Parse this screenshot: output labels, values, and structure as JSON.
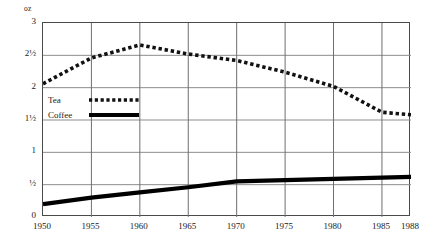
{
  "chart_data": {
    "type": "line",
    "title": "",
    "xlabel": "",
    "ylabel": "oz",
    "unit_label": "oz",
    "xlim": [
      1950,
      1988
    ],
    "ylim": [
      0,
      3
    ],
    "grid": true,
    "legend_position": "inside-upper-left",
    "x_tick_labels": [
      "1950",
      "1955",
      "1960",
      "1965",
      "1970",
      "1975",
      "1980",
      "1985",
      "1988"
    ],
    "x_ticks": [
      1950,
      1955,
      1960,
      1965,
      1970,
      1975,
      1980,
      1985,
      1988
    ],
    "y_tick_labels": [
      "3",
      "2½",
      "2",
      "1½",
      "1",
      "½",
      "0"
    ],
    "y_ticks": [
      3,
      2.5,
      2,
      1.5,
      1,
      0.5,
      0
    ],
    "series": [
      {
        "name": "Tea",
        "style": "dotted",
        "color": "#111111",
        "x": [
          1950,
          1955,
          1960,
          1965,
          1970,
          1975,
          1980,
          1985,
          1988
        ],
        "values": [
          2.06,
          2.46,
          2.66,
          2.52,
          2.42,
          2.24,
          2.02,
          1.62,
          1.58
        ]
      },
      {
        "name": "Coffee",
        "style": "solid",
        "color": "#000000",
        "x": [
          1950,
          1955,
          1960,
          1965,
          1970,
          1975,
          1980,
          1985,
          1988
        ],
        "values": [
          0.2,
          0.3,
          0.38,
          0.46,
          0.55,
          0.57,
          0.59,
          0.61,
          0.62
        ]
      }
    ],
    "legend": [
      {
        "label": "Tea",
        "style": "dotted"
      },
      {
        "label": "Coffee",
        "style": "solid"
      }
    ]
  }
}
